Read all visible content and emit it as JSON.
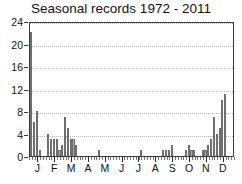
{
  "chart_data": {
    "type": "bar",
    "title": "Seasonal records 1972 - 2011",
    "xlabel": "",
    "ylabel": "",
    "ylim": [
      0,
      24
    ],
    "yticks": [
      0,
      4,
      8,
      12,
      16,
      20,
      24
    ],
    "grid": true,
    "legend": null,
    "xtick_labels": [
      "J",
      "F",
      "M",
      "A",
      "M",
      "J",
      "J",
      "A",
      "S",
      "O",
      "N",
      "D"
    ],
    "xtick_label_positions_pct": [
      4.1,
      12.3,
      20.5,
      28.8,
      37.0,
      45.2,
      53.4,
      61.6,
      69.9,
      78.1,
      86.3,
      94.5
    ],
    "bin_description": "5-day bins across the calendar year (73 bins)",
    "n_bins": 73,
    "categories": [
      "Jan 1-5",
      "Jan 6-10",
      "Jan 11-15",
      "Jan 16-20",
      "Jan 21-25",
      "Jan 26-30",
      "Jan 31-Feb 4",
      "Feb 5-9",
      "Feb 10-14",
      "Feb 15-19",
      "Feb 20-24",
      "Feb 25-Mar 1",
      "Mar 2-6",
      "Mar 7-11",
      "Mar 12-16",
      "Mar 17-21",
      "Mar 22-26",
      "Mar 27-31",
      "Apr 1-5",
      "Apr 6-10",
      "Apr 11-15",
      "Apr 16-20",
      "Apr 21-25",
      "Apr 26-30",
      "May 1-5",
      "May 6-10",
      "May 11-15",
      "May 16-20",
      "May 21-25",
      "May 26-30",
      "May 31-Jun 4",
      "Jun 5-9",
      "Jun 10-14",
      "Jun 15-19",
      "Jun 20-24",
      "Jun 25-29",
      "Jun 30-Jul 4",
      "Jul 5-9",
      "Jul 10-14",
      "Jul 15-19",
      "Jul 20-24",
      "Jul 25-29",
      "Jul 30-Aug 3",
      "Aug 4-8",
      "Aug 9-13",
      "Aug 14-18",
      "Aug 19-23",
      "Aug 24-28",
      "Aug 29-Sep 2",
      "Sep 3-7",
      "Sep 8-12",
      "Sep 13-17",
      "Sep 18-22",
      "Sep 23-27",
      "Sep 28-Oct 2",
      "Oct 3-7",
      "Oct 8-12",
      "Oct 13-17",
      "Oct 18-22",
      "Oct 23-27",
      "Oct 28-Nov 1",
      "Nov 2-6",
      "Nov 7-11",
      "Nov 12-16",
      "Nov 17-21",
      "Nov 22-26",
      "Nov 27-Dec 1",
      "Dec 2-6",
      "Dec 7-11",
      "Dec 12-16",
      "Dec 17-21",
      "Dec 22-26",
      "Dec 27-31"
    ],
    "values": [
      22,
      6,
      8,
      1,
      0,
      0,
      4,
      3,
      3,
      3,
      1,
      2,
      7,
      5,
      3,
      3,
      2,
      0,
      0,
      0,
      0,
      0,
      0,
      0,
      1,
      0,
      0,
      0,
      0,
      0,
      0,
      0,
      0,
      0,
      0,
      0,
      0,
      0,
      0,
      1,
      0,
      0,
      0,
      0,
      0,
      0,
      0,
      1,
      1,
      1,
      2,
      0,
      0,
      0,
      0,
      1,
      2,
      1,
      1,
      0,
      0,
      1,
      1,
      2,
      3,
      7,
      4,
      5,
      10,
      11,
      0,
      0,
      0
    ]
  }
}
